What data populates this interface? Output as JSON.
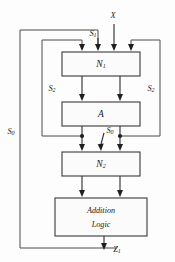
{
  "diagram": {
    "blocks": [
      {
        "id": "n1",
        "label": "N",
        "sub": "1",
        "x": 62,
        "y": 52,
        "w": 78,
        "h": 24
      },
      {
        "id": "a",
        "label": "A",
        "sub": "",
        "x": 62,
        "y": 102,
        "w": 78,
        "h": 24
      },
      {
        "id": "n2",
        "label": "N",
        "sub": "2",
        "x": 62,
        "y": 152,
        "w": 78,
        "h": 24
      },
      {
        "id": "add",
        "label_line1": "Addition",
        "label_line2": "Logic",
        "x": 55,
        "y": 198,
        "w": 92,
        "h": 38
      }
    ],
    "signals": {
      "input_x": "X",
      "control_s1": "S",
      "control_s1_sub": "1",
      "control_s2_left": "S",
      "control_s2_left_sub": "2",
      "control_s2_right": "S",
      "control_s2_right_sub": "2",
      "control_s0_mid": "S",
      "control_s0_mid_sub": "0",
      "control_s0_left": "S",
      "control_s0_left_sub": "0",
      "output_z1": "Z",
      "output_z1_sub": "1"
    },
    "colors": {
      "wire": "#4a4a4a",
      "box_stroke": "#3a3a3a",
      "box_fill": "#fbfbfb",
      "text": "#1a1a1a",
      "background": "#fdfdfd"
    }
  }
}
